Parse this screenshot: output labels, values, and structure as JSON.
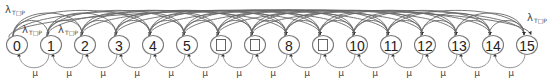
{
  "diagram": {
    "type": "markov-chain",
    "node_spacing": 34,
    "first_node_x": 17,
    "node_y": 45,
    "nodes": [
      {
        "id": 0,
        "label": "0"
      },
      {
        "id": 1,
        "label": "1"
      },
      {
        "id": 2,
        "label": "2"
      },
      {
        "id": 3,
        "label": "3"
      },
      {
        "id": 4,
        "label": "4"
      },
      {
        "id": 5,
        "label": "5"
      },
      {
        "id": 6,
        "label": "□"
      },
      {
        "id": 7,
        "label": "□"
      },
      {
        "id": 8,
        "label": "8"
      },
      {
        "id": 9,
        "label": "□"
      },
      {
        "id": 10,
        "label": "10"
      },
      {
        "id": 11,
        "label": "11"
      },
      {
        "id": 12,
        "label": "12"
      },
      {
        "id": 13,
        "label": "13"
      },
      {
        "id": 14,
        "label": "14"
      },
      {
        "id": 15,
        "label": "15"
      }
    ],
    "transition_labels": {
      "forward_rate": "λ",
      "forward_rate_subscript": "T□P",
      "back_rate": "μ"
    },
    "lambda_labels": [
      {
        "position": "top-left",
        "text": "λ",
        "sub": "T□P"
      },
      {
        "position": "node0-node1",
        "text": "λ",
        "sub": "T□P"
      },
      {
        "position": "node1-node2",
        "text": "λ",
        "sub": "T□P"
      },
      {
        "position": "top-right",
        "text": "λ",
        "sub": "T□P"
      }
    ],
    "mu_label": "μ",
    "colors": {
      "node_stroke": "#7a7a7a",
      "arc": "#666666",
      "text": "#222222"
    }
  }
}
